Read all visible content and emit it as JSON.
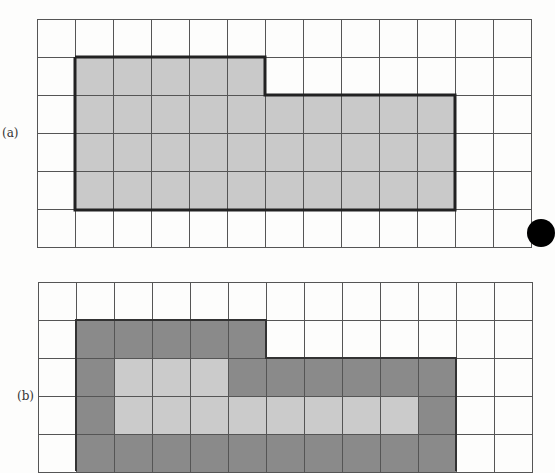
{
  "figure_a": {
    "label": "(a)",
    "columns": 13,
    "rows": 6,
    "cell_px": 38,
    "cells": [
      [
        "w",
        "w",
        "w",
        "w",
        "w",
        "w",
        "w",
        "w",
        "w",
        "w",
        "w",
        "w",
        "w"
      ],
      [
        "w",
        "s",
        "s",
        "s",
        "s",
        "s",
        "w",
        "w",
        "w",
        "w",
        "w",
        "w",
        "w"
      ],
      [
        "w",
        "s",
        "s",
        "s",
        "s",
        "s",
        "s",
        "s",
        "s",
        "s",
        "s",
        "w",
        "w"
      ],
      [
        "w",
        "s",
        "s",
        "s",
        "s",
        "s",
        "s",
        "s",
        "s",
        "s",
        "s",
        "w",
        "w"
      ],
      [
        "w",
        "s",
        "s",
        "s",
        "s",
        "s",
        "s",
        "s",
        "s",
        "s",
        "s",
        "w",
        "w"
      ],
      [
        "w",
        "w",
        "w",
        "w",
        "w",
        "w",
        "w",
        "w",
        "w",
        "w",
        "w",
        "w",
        "w"
      ]
    ],
    "shaded_area_cells": 35
  },
  "figure_b": {
    "label": "(b)",
    "columns": 13,
    "rows_visible": 5,
    "cell_px": 38,
    "cells": [
      [
        "w",
        "w",
        "w",
        "w",
        "w",
        "w",
        "w",
        "w",
        "w",
        "w",
        "w",
        "w",
        "w"
      ],
      [
        "w",
        "d",
        "d",
        "d",
        "d",
        "d",
        "w",
        "w",
        "w",
        "w",
        "w",
        "w",
        "w"
      ],
      [
        "w",
        "d",
        "l",
        "l",
        "l",
        "d",
        "d",
        "d",
        "d",
        "d",
        "d",
        "w",
        "w"
      ],
      [
        "w",
        "d",
        "l",
        "l",
        "l",
        "l",
        "l",
        "l",
        "l",
        "l",
        "d",
        "w",
        "w"
      ],
      [
        "w",
        "d",
        "d",
        "d",
        "d",
        "d",
        "d",
        "d",
        "d",
        "d",
        "d",
        "w",
        "w"
      ]
    ],
    "legend": {
      "d": "perimeter cells (dark gray)",
      "l": "interior cells (light gray)",
      "w": "empty"
    }
  },
  "colors": {
    "grid_line": "#555555",
    "shaded": "#c9c9c9",
    "dark": "#8a8a8a",
    "light": "#cbcbcb",
    "outline": "#222222",
    "background": "#fdfdfc"
  }
}
